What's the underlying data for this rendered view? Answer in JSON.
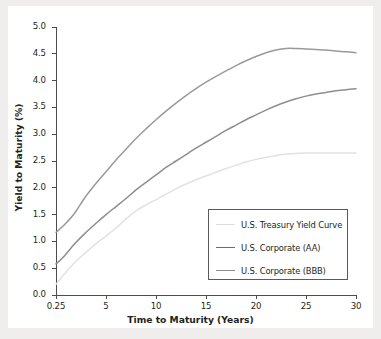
{
  "chart_data": {
    "type": "line",
    "title": "",
    "xlabel": "Time to Maturity (Years)",
    "ylabel": "Yield to Maturity (%)",
    "xticklabels": [
      "0.25",
      "5",
      "10",
      "15",
      "20",
      "25",
      "30"
    ],
    "xtickvalues": [
      0.25,
      5,
      10,
      15,
      20,
      25,
      30
    ],
    "yticklabels": [
      "0.0",
      "0.5",
      "1.0",
      "1.5",
      "2.0",
      "2.5",
      "3.0",
      "3.5",
      "4.0",
      "4.5",
      "5.0"
    ],
    "ytickvalues": [
      0.0,
      0.5,
      1.0,
      1.5,
      2.0,
      2.5,
      3.0,
      3.5,
      4.0,
      4.5,
      5.0
    ],
    "ylim": [
      0.0,
      5.0
    ],
    "xlim": [
      0.25,
      30
    ],
    "grid": false,
    "legend_position": "lower right",
    "x": [
      0.25,
      1,
      2,
      3,
      4,
      5,
      6,
      7,
      8,
      9,
      10,
      11,
      12,
      13,
      14,
      15,
      16,
      17,
      18,
      19,
      20,
      21,
      22,
      23,
      24,
      25,
      26,
      27,
      28,
      29,
      30
    ],
    "series": [
      {
        "name": "U.S. Treasury Yield Curve",
        "color": "#e2e2e2",
        "values": [
          0.2,
          0.38,
          0.6,
          0.78,
          0.95,
          1.1,
          1.25,
          1.42,
          1.57,
          1.68,
          1.78,
          1.88,
          1.98,
          2.07,
          2.15,
          2.22,
          2.29,
          2.36,
          2.42,
          2.48,
          2.53,
          2.57,
          2.6,
          2.63,
          2.64,
          2.65,
          2.65,
          2.65,
          2.65,
          2.65,
          2.65
        ]
      },
      {
        "name": "U.S. Corporate (AA)",
        "color": "#8e8e8e",
        "values": [
          0.58,
          0.72,
          0.95,
          1.15,
          1.33,
          1.5,
          1.65,
          1.8,
          1.96,
          2.1,
          2.24,
          2.38,
          2.5,
          2.62,
          2.74,
          2.85,
          2.96,
          3.07,
          3.17,
          3.27,
          3.36,
          3.45,
          3.53,
          3.6,
          3.66,
          3.71,
          3.75,
          3.78,
          3.81,
          3.83,
          3.85
        ]
      },
      {
        "name": "U.S. Corporate (BBB)",
        "color": "#9a9a9a",
        "values": [
          1.17,
          1.3,
          1.52,
          1.82,
          2.07,
          2.3,
          2.52,
          2.72,
          2.92,
          3.1,
          3.27,
          3.43,
          3.58,
          3.72,
          3.85,
          3.97,
          4.08,
          4.18,
          4.28,
          4.37,
          4.45,
          4.52,
          4.57,
          4.6,
          4.6,
          4.59,
          4.58,
          4.57,
          4.55,
          4.54,
          4.52
        ]
      }
    ]
  },
  "legend": {
    "items": [
      {
        "label": "U.S. Treasury Yield Curve",
        "color": "#dcdcdc"
      },
      {
        "label": "U.S. Corporate (AA)",
        "color": "#6d6d6d"
      },
      {
        "label": "U.S. Corporate (BBB)",
        "color": "#8a8a8a"
      }
    ]
  }
}
